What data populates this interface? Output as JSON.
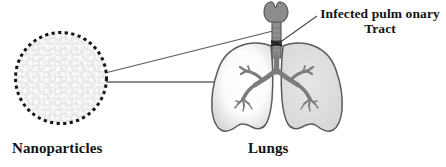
{
  "figure": {
    "type": "anatomical-diagram",
    "background_color": "#ffffff"
  },
  "labels": {
    "nanoparticles": "Nanoparticles",
    "lungs": "Lungs",
    "infected_tract_line1": "Infected pulm onary",
    "infected_tract_line2": "Tract"
  },
  "elements": {
    "nanoparticle_circle": {
      "name": "nanoparticle-sphere",
      "center_x": 61,
      "center_y": 78,
      "radius": 46,
      "fill_color": "#e9e9e9",
      "dot_color": "#fcfcfc",
      "border_style": "dashed",
      "border_color": "#1a1a1a",
      "border_width": 3
    },
    "lungs": {
      "name": "lungs-illustration",
      "outline_color": "#5d5d5d",
      "left_lobe_fill": "#fdfdfd",
      "left_lobe_rim_fill": "#dcdcdc",
      "right_lobe_fill": "#e0e0e0",
      "bronchi_color": "#7a7a7a",
      "trachea_color": "#8a8a8a",
      "larynx_color": "#8c8c8c",
      "infection_marker_color": "#3b3b3b"
    },
    "leader_lines": {
      "name": "leader-lines",
      "color": "#555555",
      "width": 1,
      "count": 3
    }
  }
}
